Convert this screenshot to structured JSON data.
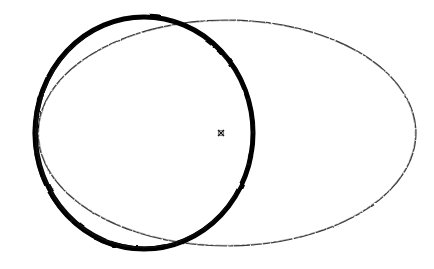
{
  "figure": {
    "title": "Overlapping circle and ellipse outline drawing",
    "background_color": "#ffffff",
    "canvas": {
      "width": 434,
      "height": 269
    },
    "shapes": [
      {
        "id": "thick-circle",
        "name": "thick-circle",
        "kind": "circle",
        "label": "Thick black circle",
        "center_x": 144,
        "center_y": 133,
        "radius_x": 109,
        "radius_y": 116,
        "stroke_color": "#070707",
        "stroke_width": 5.2,
        "fill": "none",
        "style": "solid hand-drawn heavy outline"
      },
      {
        "id": "thin-ellipse",
        "name": "thin-ellipse",
        "kind": "ellipse",
        "label": "Thin black ellipse",
        "center_x": 227,
        "center_y": 133,
        "radius_x": 189,
        "radius_y": 113,
        "stroke_color": "#2b2b2b",
        "stroke_width": 1.1,
        "fill": "none",
        "style": "faint broken hand-drawn light outline"
      }
    ],
    "markers": [
      {
        "id": "center-cross",
        "name": "center-cross-marker",
        "glyph": "x",
        "x": 221,
        "y": 133,
        "size": 6,
        "color": "#1a1a1a",
        "label": "Small x marker at ellipse center"
      }
    ],
    "intersections": [
      {
        "name": "top-intersection",
        "x": 171,
        "y": 20
      },
      {
        "name": "bottom-intersection",
        "x": 170,
        "y": 246
      }
    ],
    "extents": {
      "thick_circle_left": 35,
      "thick_circle_right": 253,
      "thick_circle_top": 17,
      "thick_circle_bottom": 249,
      "thin_ellipse_left": 38,
      "thin_ellipse_right": 416,
      "thin_ellipse_top": 20,
      "thin_ellipse_bottom": 246
    }
  }
}
